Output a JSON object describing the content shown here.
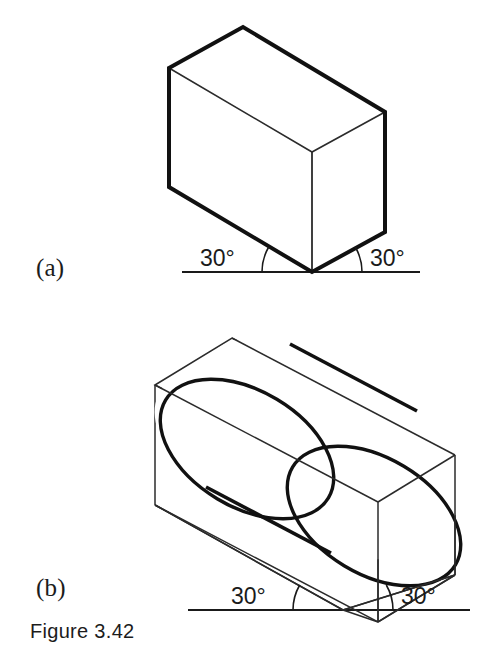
{
  "figure": {
    "caption": "Figure 3.42",
    "parts": [
      {
        "id": "a",
        "label": "(a)",
        "subject": "rectangular-box-isometric",
        "angles": [
          {
            "value": "30°",
            "side": "left"
          },
          {
            "value": "30°",
            "side": "right"
          }
        ]
      },
      {
        "id": "b",
        "label": "(b)",
        "subject": "cylinder-in-wireframe-box-isometric",
        "angles": [
          {
            "value": "30°",
            "side": "left"
          },
          {
            "value": "30°",
            "side": "right"
          }
        ]
      }
    ]
  },
  "colors": {
    "background": "#ffffff",
    "ink": "#1a1a1a",
    "heavy_line": "#111111",
    "light_line": "#2b2b2b"
  },
  "geometry": {
    "part_a": {
      "ground_line": {
        "x1": 182,
        "y1": 272,
        "x2": 420,
        "y2": 272
      },
      "bottom_vertex": {
        "x": 312,
        "y": 272
      },
      "top_apex": {
        "x": 243,
        "y": 27
      },
      "left_vertical": {
        "x": 169,
        "y_top": 68,
        "y_bottom": 187
      },
      "center_vertical": {
        "x": 312,
        "y_top": 152,
        "y_bottom": 272
      },
      "right_vertical": {
        "x": 385,
        "y_top": 112,
        "y_bottom": 232
      }
    },
    "part_b": {
      "ground_line": {
        "x1": 188,
        "y1": 610,
        "x2": 470,
        "y2": 610
      },
      "bottom_vertex": {
        "x": 343,
        "y": 610
      },
      "box_left_top": {
        "x": 155,
        "y": 385
      },
      "box_back_top": {
        "x": 232,
        "y": 338
      },
      "box_right_top": {
        "x": 455,
        "y": 455
      }
    }
  }
}
